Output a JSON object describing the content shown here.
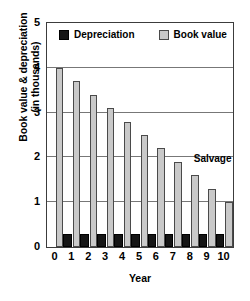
{
  "chart_data": {
    "type": "bar",
    "title": "",
    "xlabel": "Year",
    "ylabel": "Book value & depreciation (in thousands)",
    "ylabel_line1": "Book value & depreciation",
    "ylabel_line2": "(in thousands)",
    "categories": [
      "0",
      "1",
      "2",
      "3",
      "4",
      "5",
      "6",
      "7",
      "8",
      "9",
      "10"
    ],
    "series": [
      {
        "name": "Depreciation",
        "color": "#151515",
        "values": [
          0,
          0.3,
          0.3,
          0.3,
          0.3,
          0.3,
          0.3,
          0.3,
          0.3,
          0.3,
          0.3
        ]
      },
      {
        "name": "Book value",
        "color": "#c9c9c9",
        "values": [
          4.0,
          3.7,
          3.4,
          3.1,
          2.8,
          2.5,
          2.2,
          1.9,
          1.6,
          1.3,
          1.0
        ]
      }
    ],
    "ylim": [
      0,
      5
    ],
    "yticks": [
      "0",
      "1",
      "2",
      "3",
      "4",
      "5"
    ],
    "ytick_values": [
      0,
      1,
      2,
      3,
      4,
      5
    ],
    "xticks": [
      "0",
      "1",
      "2",
      "3",
      "4",
      "5",
      "6",
      "7",
      "8",
      "9",
      "10"
    ],
    "grid": true,
    "gridlines_y": [
      1,
      2,
      3,
      4
    ],
    "legend_position": "top-inside",
    "annotations": [
      {
        "text": "Salvage",
        "x": 8,
        "y": 1.85
      }
    ]
  },
  "legend": {
    "entries": [
      {
        "label": "Depreciation",
        "swatch": "dark-square-swatch"
      },
      {
        "label": "Book value",
        "swatch": "light-square-swatch"
      }
    ]
  }
}
